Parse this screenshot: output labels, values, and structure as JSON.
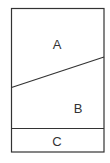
{
  "diagram": {
    "regions": [
      {
        "id": "A",
        "label": "A",
        "x": 57,
        "y": 44
      },
      {
        "id": "B",
        "label": "B",
        "x": 78,
        "y": 108
      },
      {
        "id": "C",
        "label": "C",
        "x": 57,
        "y": 141
      }
    ],
    "colors": {
      "stroke": "#333333",
      "fill": "#ffffff",
      "text": "#333333"
    }
  }
}
